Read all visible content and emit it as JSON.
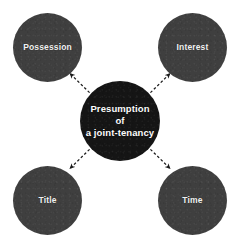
{
  "diagram": {
    "title_text": "Presumption of a joint-tenancy",
    "background_color": "#ffffff",
    "center_node": {
      "label_line_1": "Presumption of",
      "label_line_2": "a joint-tenancy",
      "color": "#151515",
      "text_color": "#ffffff"
    },
    "satellite_color": "#3f3f3f",
    "satellite_text_color": "#f2f2f2",
    "connector_color": "#1a1a1a",
    "connector_style": "dashed-arrow",
    "nodes": [
      {
        "id": "possession",
        "label": "Possession",
        "position": "top-left"
      },
      {
        "id": "interest",
        "label": "Interest",
        "position": "top-right"
      },
      {
        "id": "title",
        "label": "Title",
        "position": "bottom-left"
      },
      {
        "id": "time",
        "label": "Time",
        "position": "bottom-right"
      }
    ]
  }
}
